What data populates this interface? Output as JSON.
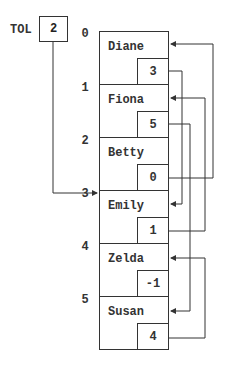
{
  "head": {
    "label": "TOL",
    "value": "2"
  },
  "nodes": [
    {
      "index": "0",
      "name": "Diane",
      "next": "3"
    },
    {
      "index": "1",
      "name": "Fiona",
      "next": "5"
    },
    {
      "index": "2",
      "name": "Betty",
      "next": "0"
    },
    {
      "index": "3",
      "name": "Emily",
      "next": "1"
    },
    {
      "index": "4",
      "name": "Zelda",
      "next": "-1"
    },
    {
      "index": "5",
      "name": "Susan",
      "next": "4"
    }
  ],
  "colors": {
    "line": "#333333",
    "background": "#ffffff"
  }
}
